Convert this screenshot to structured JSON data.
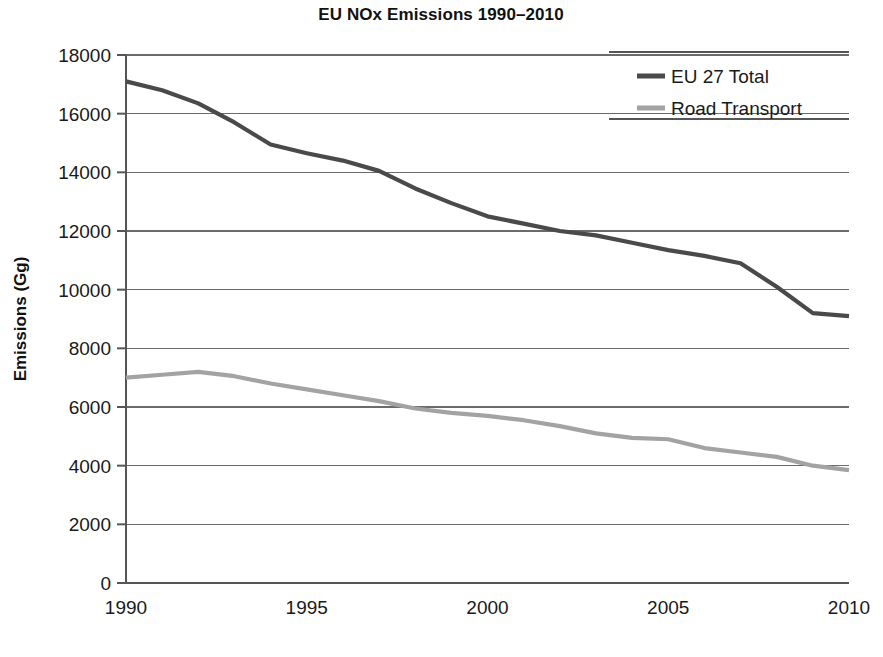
{
  "chart_data": {
    "type": "line",
    "title": "EU NOx Emissions  1990–2010",
    "xlabel": "",
    "ylabel": "Emissions (Gg)",
    "xlim": [
      1990,
      2010
    ],
    "ylim": [
      0,
      18000
    ],
    "grid": true,
    "legend_position": "top-right",
    "x": [
      1990,
      1991,
      1992,
      1993,
      1994,
      1995,
      1996,
      1997,
      1998,
      1999,
      2000,
      2001,
      2002,
      2003,
      2004,
      2005,
      2006,
      2007,
      2008,
      2009,
      2010
    ],
    "xticks": [
      1990,
      1995,
      2000,
      2005,
      2010
    ],
    "xtick_labels": [
      "1990",
      "1995",
      "2000",
      "2005",
      "2010"
    ],
    "yticks": [
      0,
      2000,
      4000,
      6000,
      8000,
      10000,
      12000,
      14000,
      16000,
      18000
    ],
    "ytick_labels": [
      "0",
      "2000",
      "4000",
      "6000",
      "8000",
      "10000",
      "12000",
      "14000",
      "16000",
      "18000"
    ],
    "series": [
      {
        "name": "EU 27 Total",
        "color": "#4a4a4a",
        "width": 4.2,
        "values": [
          17100,
          16800,
          16350,
          15700,
          14950,
          14650,
          14400,
          14050,
          13450,
          12950,
          12500,
          12250,
          12000,
          11850,
          11600,
          11350,
          11150,
          10900,
          10100,
          9200,
          9100
        ]
      },
      {
        "name": "Road Transport",
        "color": "#a3a3a3",
        "width": 4.2,
        "values": [
          7000,
          7100,
          7200,
          7050,
          6800,
          6600,
          6400,
          6200,
          5950,
          5800,
          5700,
          5550,
          5350,
          5100,
          4950,
          4900,
          4600,
          4450,
          4300,
          4000,
          3850
        ]
      }
    ]
  },
  "legend": {
    "items": [
      {
        "label": "EU 27 Total",
        "color": "#4a4a4a"
      },
      {
        "label": "Road Transport",
        "color": "#a3a3a3"
      }
    ]
  }
}
